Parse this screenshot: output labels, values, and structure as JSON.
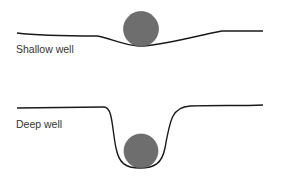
{
  "diagram": {
    "wells": [
      {
        "label": "Shallow well"
      },
      {
        "label": "Deep well"
      }
    ],
    "colors": {
      "line": "#1a1a1a",
      "ball": "#6e6e6e",
      "background": "#ffffff"
    }
  }
}
